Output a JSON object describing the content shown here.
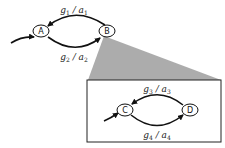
{
  "diagram": {
    "type": "state-machine-with-zoom-inset",
    "top_machine": {
      "nodes": [
        {
          "id": "A",
          "label": "A"
        },
        {
          "id": "B",
          "label": "B"
        }
      ],
      "edges": [
        {
          "from": "B",
          "to": "A",
          "guard": "g",
          "guard_sub": "1",
          "action": "a",
          "action_sub": "1"
        },
        {
          "from": "A",
          "to": "B",
          "guard": "g",
          "guard_sub": "2",
          "action": "a",
          "action_sub": "2"
        }
      ],
      "initial": "A"
    },
    "inset_machine": {
      "expands": "B",
      "nodes": [
        {
          "id": "C",
          "label": "C"
        },
        {
          "id": "D",
          "label": "D"
        }
      ],
      "edges": [
        {
          "from": "D",
          "to": "C",
          "guard": "g",
          "guard_sub": "3",
          "action": "a",
          "action_sub": "3"
        },
        {
          "from": "C",
          "to": "D",
          "guard": "g",
          "guard_sub": "4",
          "action": "a",
          "action_sub": "4"
        }
      ],
      "initial": "C"
    },
    "separator": "/",
    "colors": {
      "stroke": "#111111",
      "projection_fill": "#a8a8a8",
      "background": "#ffffff"
    }
  }
}
